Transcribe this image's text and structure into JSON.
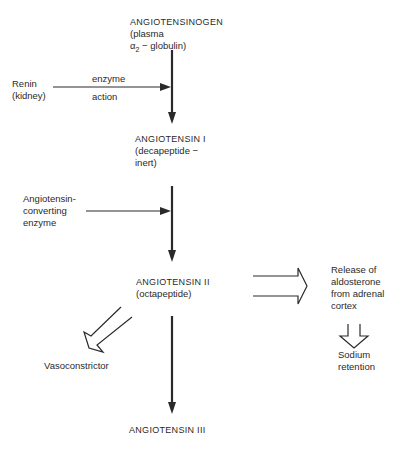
{
  "diagram": {
    "nodes": {
      "angiotensinogen": {
        "name": "ANGIOTENSINOGEN",
        "line2": "(plasma",
        "line3_prefix": "α",
        "line3_sub": "2",
        "line3_suffix": " − globulin)"
      },
      "renin": {
        "line1": "Renin",
        "line2": "(kidney)"
      },
      "enzyme_action": {
        "above": "enzyme",
        "below": "action"
      },
      "angiotensin1": {
        "name": "ANGIOTENSIN I",
        "line2": "(decapeptide −",
        "line3": "inert)"
      },
      "ace": {
        "line1": "Angiotensin-",
        "line2": "converting",
        "line3": "enzyme"
      },
      "angiotensin2": {
        "name": "ANGIOTENSIN II",
        "line2": "(octapeptide)"
      },
      "aldosterone": {
        "line1": "Release of",
        "line2": "aldosterone",
        "line3": "from adrenal",
        "line4": "cortex"
      },
      "sodium": {
        "line1": "Sodium",
        "line2": "retention"
      },
      "vasoconstrictor": {
        "label": "Vasoconstrictor"
      },
      "angiotensin3": {
        "name": "ANGIOTENSIN III"
      }
    },
    "colors": {
      "ink": "#2a2a2a",
      "background": "#ffffff"
    }
  }
}
